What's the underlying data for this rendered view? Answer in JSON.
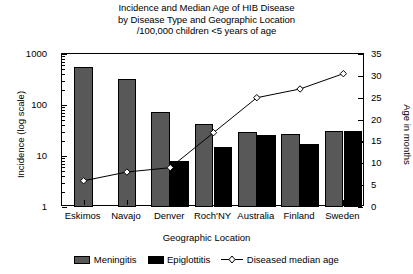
{
  "title": {
    "line1": "Incidence and Median Age of HIB Disease",
    "line2": "by Disease Type and Geographic Location",
    "line3": "/100,000 children <5 years of age"
  },
  "axes": {
    "left_title": "Incidence (log scale)",
    "right_title": "Age in months",
    "x_title": "Geographic Location",
    "left_ticks": [
      "1",
      "10",
      "100",
      "1000"
    ],
    "right_ticks": [
      "0",
      "5",
      "10",
      "15",
      "20",
      "25",
      "30",
      "35"
    ]
  },
  "legend": {
    "meningitis": "Meningitis",
    "epiglottitis": "Epiglottitis",
    "median_age": "Diseased median age"
  },
  "colors": {
    "meningitis": "#585858",
    "epiglottitis": "#000000",
    "line": "#000000",
    "background": "#ffffff"
  },
  "chart_data": {
    "type": "bar",
    "title": "Incidence and Median Age of HIB Disease by Disease Type and Geographic Location /100,000 children <5 years of age",
    "xlabel": "Geographic Location",
    "ylabel": "Incidence (log scale)",
    "y2label": "Age in months",
    "categories": [
      "Eskimos",
      "Navajo",
      "Denver",
      "Roch'NY",
      "Australia",
      "Finland",
      "Sweden"
    ],
    "yscale": "log",
    "ylim": [
      1,
      1000
    ],
    "y2lim": [
      0,
      35
    ],
    "grid": false,
    "legend_position": "bottom",
    "series": [
      {
        "name": "Meningitis",
        "type": "bar",
        "axis": "left",
        "values": [
          550,
          330,
          73,
          42,
          29,
          27,
          31
        ]
      },
      {
        "name": "Epiglottitis",
        "type": "bar",
        "axis": "left",
        "values": [
          null,
          null,
          8,
          15,
          26,
          17,
          31
        ]
      },
      {
        "name": "Diseased median age",
        "type": "line",
        "axis": "right",
        "marker": "open-diamond",
        "values": [
          6,
          8,
          9,
          17,
          25,
          27,
          30.5
        ]
      }
    ]
  }
}
